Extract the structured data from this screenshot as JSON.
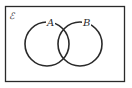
{
  "diagram": {
    "type": "venn",
    "universal_set_label": "ℰ",
    "sets": [
      {
        "label": "A"
      },
      {
        "label": "B"
      }
    ],
    "colors": {
      "stroke": "#2a2a2a",
      "background": "#ffffff"
    }
  }
}
